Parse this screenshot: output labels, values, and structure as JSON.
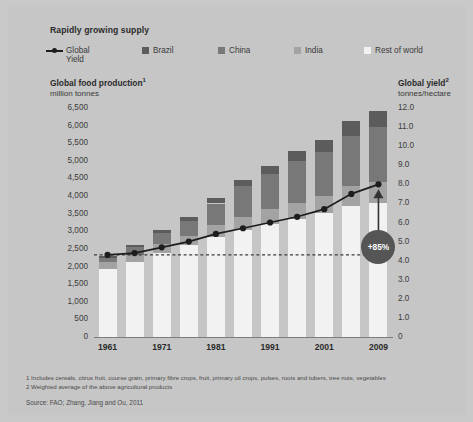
{
  "header": {
    "title": "Rapidly growing supply"
  },
  "legend": {
    "items": [
      {
        "label_line1": "Global",
        "label_line2": "Yield",
        "icon": "line-marker-icon",
        "type": "line",
        "color": "#1d1d1d"
      },
      {
        "label_line1": "Brazil",
        "label_line2": "",
        "icon": "square-swatch-icon",
        "type": "swatch",
        "color": "#5c5c5c"
      },
      {
        "label_line1": "China",
        "label_line2": "",
        "icon": "square-swatch-icon",
        "type": "swatch",
        "color": "#787878"
      },
      {
        "label_line1": "India",
        "label_line2": "",
        "icon": "square-swatch-icon",
        "type": "swatch",
        "color": "#a3a3a3"
      },
      {
        "label_line1": "Rest of world",
        "label_line2": "",
        "icon": "square-swatch-icon",
        "type": "swatch",
        "color": "#f2f2f2"
      }
    ]
  },
  "left_axis": {
    "title": "Global food production",
    "title_superscript": "1",
    "units": "million tonnes",
    "ticks": [
      "6,500",
      "6,000",
      "5,500",
      "5,000",
      "4,500",
      "4,000",
      "3,500",
      "3,000",
      "2,500",
      "2,000",
      "1,500",
      "1,000",
      "500",
      "0"
    ]
  },
  "right_axis": {
    "title": "Global yield",
    "title_superscript": "2",
    "units": "tonnes/hectare",
    "ticks": [
      "12.0",
      "11.0",
      "10.0",
      "9.0",
      "8.0",
      "7.0",
      "6.0",
      "5.0",
      "4.0",
      "3.0",
      "2.0",
      "1.0",
      "0"
    ]
  },
  "annotation": {
    "badge_label": "+85%"
  },
  "footnotes": {
    "note1": "1  Includes cereals, citrus fruit, course grain, primary fibre crops, fruit, primary oil crops, pulses, roots and tubers, tree nuts, vegetables",
    "note2": "2  Weighted average of the above agricultural products",
    "source": "Source: FAO; Zhang, Jiang and Ou, 2011"
  },
  "chart_data": {
    "type": "bar",
    "title": "Rapidly growing supply",
    "subtitle": "",
    "xlabel": "",
    "ylabel": "million tonnes",
    "y2label": "tonnes/hectare",
    "ylim": [
      0,
      6500
    ],
    "y2lim": [
      0,
      12
    ],
    "grid": false,
    "legend_position": "top",
    "stacked": true,
    "categories": [
      "1961",
      "1966",
      "1971",
      "1976",
      "1981",
      "1986",
      "1991",
      "1996",
      "2001",
      "2006",
      "2009"
    ],
    "tick_labels_shown": [
      "1961",
      "",
      "1971",
      "",
      "1981",
      "",
      "1991",
      "",
      "2001",
      "",
      "2009"
    ],
    "series": [
      {
        "name": "Rest of world",
        "color": "#f2f2f2",
        "values": [
          1930,
          2130,
          2380,
          2600,
          2850,
          3040,
          3200,
          3340,
          3520,
          3720,
          3800
        ]
      },
      {
        "name": "India",
        "color": "#a3a3a3",
        "values": [
          190,
          210,
          250,
          270,
          320,
          370,
          420,
          470,
          490,
          560,
          600
        ]
      },
      {
        "name": "China",
        "color": "#787878",
        "values": [
          130,
          210,
          320,
          420,
          620,
          870,
          1020,
          1180,
          1240,
          1430,
          1560
        ]
      },
      {
        "name": "Brazil",
        "color": "#5c5c5c",
        "values": [
          60,
          70,
          90,
          120,
          170,
          190,
          220,
          280,
          330,
          420,
          460
        ]
      }
    ],
    "totals": [
      2310,
      2620,
      3040,
      3410,
      3960,
      4470,
      4860,
      5270,
      5580,
      6130,
      6420
    ],
    "line_series": {
      "name": "Global Yield",
      "color": "#1d1d1d",
      "axis": "right",
      "values": [
        4.3,
        4.4,
        4.7,
        5.0,
        5.4,
        5.7,
        6.0,
        6.3,
        6.7,
        7.5,
        8.0
      ]
    },
    "reference_line": {
      "type": "dashed-horizontal",
      "axis": "right",
      "value": 4.3,
      "color": "#3a3a3a"
    },
    "annotations": [
      {
        "text": "+85%",
        "type": "arrow-badge",
        "at_category": "2009",
        "from_value": 4.3,
        "to_value": 8.0
      }
    ]
  }
}
